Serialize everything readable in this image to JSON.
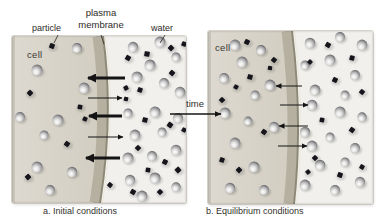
{
  "annotations": {
    "particle": "particle",
    "plasma_line1": "plasma",
    "plasma_line2": "membrane",
    "water": "water"
  },
  "time_label": "time",
  "colors": {
    "outside": "#f1f0ec",
    "cell_light": "#ddd9d0",
    "cell_dark": "#d2cec2",
    "membrane": "#b5b0a0",
    "membrane_edge": "#8e8977",
    "membrane_rim": "#ece9dd",
    "particle": "#16151c",
    "arrow": "#141414",
    "text": "#2e2b27"
  },
  "pointer_lines": [
    [
      58,
      35,
      54,
      43
    ],
    [
      101,
      35,
      104,
      44
    ],
    [
      165,
      35,
      160,
      43
    ]
  ],
  "time_arrow": [
    170,
    114,
    221,
    114
  ],
  "panels": [
    {
      "id": "initial",
      "cell_label": "cell",
      "caption": "a. Initial conditions",
      "spheres": [
        [
          25,
          34,
          5.5
        ],
        [
          65,
          12,
          5
        ],
        [
          72,
          52,
          5.5
        ],
        [
          8,
          81,
          5
        ],
        [
          46,
          84,
          5.5
        ],
        [
          32,
          99,
          4.6
        ],
        [
          25,
          131,
          5.5
        ],
        [
          60,
          136,
          5.2
        ],
        [
          38,
          154,
          5
        ],
        [
          121,
          11,
          5.2
        ],
        [
          148,
          6,
          5.5
        ],
        [
          138,
          29,
          5.5
        ],
        [
          164,
          21,
          4.6
        ],
        [
          125,
          41,
          5.5
        ],
        [
          152,
          47,
          5
        ],
        [
          168,
          56,
          5.3
        ],
        [
          116,
          77,
          4.6
        ],
        [
          143,
          76,
          5.5
        ],
        [
          166,
          82,
          5
        ],
        [
          123,
          99,
          5.4
        ],
        [
          150,
          96,
          4.5
        ],
        [
          116,
          122,
          5.5
        ],
        [
          140,
          120,
          5
        ],
        [
          164,
          114,
          5.3
        ],
        [
          118,
          144,
          5.2
        ],
        [
          143,
          142,
          5.5
        ],
        [
          164,
          151,
          4.7
        ],
        [
          130,
          160,
          5.4
        ]
      ],
      "squares": [
        [
          40,
          10,
          5,
          20
        ],
        [
          18,
          57,
          5,
          45
        ],
        [
          68,
          71,
          4.6,
          10
        ],
        [
          55,
          108,
          5,
          35
        ],
        [
          16,
          141,
          5,
          50
        ],
        [
          73,
          83,
          4.4,
          25
        ],
        [
          98,
          149,
          4.6,
          40
        ],
        [
          114,
          63,
          4.2,
          15
        ],
        [
          116,
          22,
          5,
          30
        ],
        [
          135,
          18,
          5.2,
          10
        ],
        [
          159,
          12,
          5,
          45
        ],
        [
          128,
          54,
          4.8,
          20
        ],
        [
          160,
          37,
          5,
          40
        ],
        [
          114,
          52,
          4.5,
          60
        ],
        [
          133,
          84,
          5,
          15
        ],
        [
          158,
          89,
          5.2,
          35
        ],
        [
          126,
          112,
          4.8,
          45
        ],
        [
          153,
          126,
          5,
          25
        ],
        [
          136,
          134,
          4.6,
          10
        ],
        [
          166,
          134,
          5.2,
          50
        ],
        [
          121,
          156,
          5,
          30
        ],
        [
          148,
          156,
          4.8,
          45
        ],
        [
          172,
          8,
          4.6,
          20
        ],
        [
          172,
          94,
          4.4,
          30
        ]
      ],
      "arrows": [
        {
          "x1": 113,
          "y1": 42,
          "x2": 76,
          "y2": 42,
          "thick": true
        },
        {
          "x1": 76,
          "y1": 62,
          "x2": 110,
          "y2": 62,
          "thick": false
        },
        {
          "x1": 110,
          "y1": 80,
          "x2": 77,
          "y2": 80,
          "thick": true
        },
        {
          "x1": 76,
          "y1": 101,
          "x2": 111,
          "y2": 101,
          "thick": false
        },
        {
          "x1": 108,
          "y1": 122,
          "x2": 74,
          "y2": 122,
          "thick": true
        }
      ]
    },
    {
      "id": "equilibrium",
      "cell_label": "cell",
      "caption": "b. Equilibrium conditions",
      "spheres": [
        [
          27,
          14,
          5.4
        ],
        [
          53,
          19,
          5
        ],
        [
          34,
          31,
          5.5
        ],
        [
          16,
          47,
          5
        ],
        [
          62,
          54,
          5.4
        ],
        [
          47,
          64,
          4.6
        ],
        [
          17,
          82,
          5.5
        ],
        [
          66,
          96,
          5.2
        ],
        [
          27,
          112,
          5.4
        ],
        [
          40,
          90,
          4.4
        ],
        [
          46,
          136,
          5.5
        ],
        [
          22,
          157,
          5.2
        ],
        [
          56,
          159,
          5
        ],
        [
          102,
          12,
          5.3
        ],
        [
          132,
          6,
          5
        ],
        [
          154,
          14,
          5.4
        ],
        [
          97,
          34,
          4.6
        ],
        [
          122,
          29,
          5.5
        ],
        [
          147,
          44,
          5
        ],
        [
          107,
          59,
          5.4
        ],
        [
          137,
          64,
          4.5
        ],
        [
          104,
          74,
          5.3
        ],
        [
          132,
          81,
          5.5
        ],
        [
          154,
          86,
          4.7
        ],
        [
          97,
          101,
          5.2
        ],
        [
          122,
          106,
          4.5
        ],
        [
          104,
          115,
          5.4
        ],
        [
          147,
          117,
          5
        ],
        [
          112,
          134,
          5.3
        ],
        [
          137,
          131,
          4.6
        ],
        [
          97,
          154,
          5.4
        ],
        [
          127,
          159,
          5
        ],
        [
          152,
          151,
          5.2
        ]
      ],
      "squares": [
        [
          39,
          11,
          5,
          25
        ],
        [
          66,
          29,
          4.8,
          40
        ],
        [
          42,
          46,
          5,
          15
        ],
        [
          14,
          69,
          4.8,
          45
        ],
        [
          28,
          56,
          4.4,
          30
        ],
        [
          62,
          37,
          4.2,
          10
        ],
        [
          56,
          101,
          5,
          35
        ],
        [
          14,
          129,
          4.8,
          20
        ],
        [
          31,
          139,
          5,
          45
        ],
        [
          120,
          14,
          5,
          30
        ],
        [
          144,
          27,
          4.8,
          15
        ],
        [
          102,
          31,
          4.4,
          45
        ],
        [
          127,
          49,
          5,
          25
        ],
        [
          154,
          61,
          4.8,
          40
        ],
        [
          114,
          89,
          4.6,
          10
        ],
        [
          144,
          99,
          5,
          35
        ],
        [
          107,
          127,
          4.8,
          45
        ],
        [
          132,
          144,
          5,
          20
        ],
        [
          154,
          136,
          4.6,
          30
        ],
        [
          100,
          141,
          4.4,
          50
        ]
      ],
      "arrows": [
        {
          "x1": 94,
          "y1": 55,
          "x2": 68,
          "y2": 55,
          "thick": false
        },
        {
          "x1": 72,
          "y1": 74,
          "x2": 100,
          "y2": 74,
          "thick": false
        },
        {
          "x1": 100,
          "y1": 95,
          "x2": 71,
          "y2": 95,
          "thick": false
        },
        {
          "x1": 70,
          "y1": 115,
          "x2": 99,
          "y2": 115,
          "thick": false
        }
      ]
    }
  ]
}
